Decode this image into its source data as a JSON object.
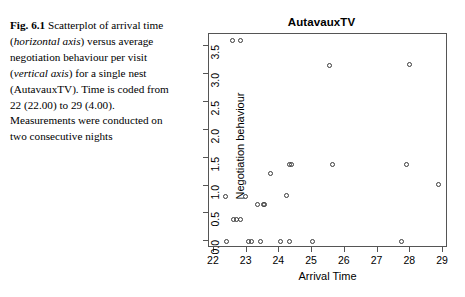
{
  "caption": {
    "figure_label": "Fig. 6.1",
    "segments": [
      {
        "text": "Scatterplot of arrival time (",
        "style": "normal"
      },
      {
        "text": "horizontal axis",
        "style": "italic"
      },
      {
        "text": ") versus average negotiation behaviour per visit (",
        "style": "normal"
      },
      {
        "text": "vertical axis",
        "style": "italic"
      },
      {
        "text": ") for a single nest (AutavauxTV). Time is coded from 22 (22.00) to 29 (4.00). Measurements were conducted on two consecutive nights",
        "style": "normal"
      }
    ],
    "full_text": "Fig. 6.1 Scatterplot of arrival time (horizontal axis) versus average negotiation behaviour per visit (vertical axis) for a single nest (AutavauxTV). Time is coded from 22 (22.00) to 29 (4.00). Measurements were conducted on two consecutive nights"
  },
  "chart_data": {
    "type": "scatter",
    "title": "AutavauxTV",
    "xlabel": "Arrival Time",
    "ylabel": "Negotiation behaviour",
    "xlim": [
      21.85,
      29.15
    ],
    "ylim": [
      -0.12,
      3.72
    ],
    "xticks": [
      22,
      23,
      24,
      25,
      26,
      27,
      28,
      29
    ],
    "xticklabels": [
      "22",
      "23",
      "24",
      "25",
      "26",
      "27",
      "28",
      "29"
    ],
    "yticks": [
      0.0,
      0.5,
      1.0,
      1.5,
      2.0,
      2.5,
      3.0,
      3.5
    ],
    "yticklabels": [
      "0.0",
      "0.5",
      "1.0",
      "1.5",
      "2.0",
      "2.5",
      "3.0",
      "3.5"
    ],
    "grid": false,
    "legend": null,
    "marker": "open-circle",
    "marker_color": "#3a3a3a",
    "points": [
      {
        "x": 22.58,
        "y": 3.6
      },
      {
        "x": 22.8,
        "y": 3.6
      },
      {
        "x": 25.52,
        "y": 3.16
      },
      {
        "x": 27.98,
        "y": 3.17
      },
      {
        "x": 24.3,
        "y": 1.38
      },
      {
        "x": 24.38,
        "y": 1.38
      },
      {
        "x": 25.62,
        "y": 1.38
      },
      {
        "x": 27.88,
        "y": 1.38
      },
      {
        "x": 28.85,
        "y": 1.02
      },
      {
        "x": 23.72,
        "y": 1.22
      },
      {
        "x": 22.35,
        "y": 0.8
      },
      {
        "x": 22.95,
        "y": 0.8
      },
      {
        "x": 24.22,
        "y": 0.82
      },
      {
        "x": 23.32,
        "y": 0.66
      },
      {
        "x": 23.5,
        "y": 0.66
      },
      {
        "x": 23.56,
        "y": 0.66
      },
      {
        "x": 22.6,
        "y": 0.4
      },
      {
        "x": 22.7,
        "y": 0.4
      },
      {
        "x": 22.8,
        "y": 0.4
      },
      {
        "x": 22.38,
        "y": 0.0
      },
      {
        "x": 23.05,
        "y": 0.0
      },
      {
        "x": 23.16,
        "y": 0.0
      },
      {
        "x": 23.42,
        "y": 0.0
      },
      {
        "x": 24.02,
        "y": 0.0
      },
      {
        "x": 24.3,
        "y": 0.0
      },
      {
        "x": 25.0,
        "y": 0.0
      },
      {
        "x": 27.72,
        "y": 0.0
      }
    ]
  }
}
